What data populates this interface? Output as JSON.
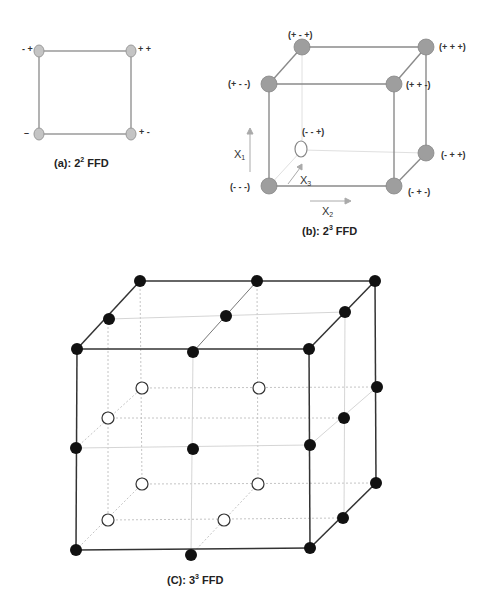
{
  "figure_a": {
    "caption": "(a):  2",
    "caption_sup": "2",
    "caption_tail": " FFD",
    "corner_labels": {
      "top_left": "- +",
      "top_right": "+ +",
      "bottom_left": "–",
      "bottom_right": "+ -"
    },
    "point_color": "#c0c0c0"
  },
  "figure_b": {
    "caption": "(b):  2",
    "caption_sup": "3",
    "caption_tail": " FFD",
    "vertex_labels": {
      "p_mm_p": "(+ - +)",
      "p_pp_p": "(+ + +)",
      "p_mm_m": "(+ - -)",
      "p_pp_m": "(+ + -)",
      "m_mm_p": "(- - +)",
      "m_pp_p": "(- + +)",
      "m_mm_m": "(- - -)",
      "m_pp_m": "(- + -)"
    },
    "axes": {
      "x1": "X",
      "x1_sub": "1",
      "x2": "X",
      "x2_sub": "2",
      "x3": "X",
      "x3_sub": "3"
    },
    "point_color": "#9a9a9a"
  },
  "figure_c": {
    "caption": "(C):  3",
    "caption_sup": "3",
    "caption_tail": " FFD",
    "filled_color": "#111111",
    "hollow_count": 8,
    "filled_count": 19
  }
}
